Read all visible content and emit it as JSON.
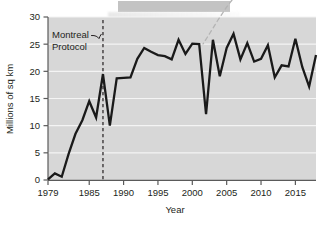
{
  "figure": {
    "redacted_caption_present": true,
    "background_color": "#ffffff"
  },
  "chart_data": {
    "type": "line",
    "title": "",
    "xlabel": "Year",
    "ylabel": "Millions of sq km",
    "xlim": [
      1979,
      2018
    ],
    "ylim": [
      0,
      30
    ],
    "grid": true,
    "grid_orientation": "horizontal",
    "legend_position": "none",
    "plot_background_color": "#d7d7d7",
    "gridline_color": "#f4f4f4",
    "series_color": "#1a1a1a",
    "xticks": [
      1979,
      1985,
      1990,
      1995,
      2000,
      2005,
      2010,
      2015
    ],
    "xtick_labels": [
      "1979",
      "1985",
      "1990",
      "1995",
      "2000",
      "2005",
      "2010",
      "2015"
    ],
    "yticks": [
      0,
      5,
      10,
      15,
      20,
      25,
      30
    ],
    "ytick_labels": [
      "0",
      "5",
      "10",
      "15",
      "20",
      "25",
      "30"
    ],
    "x": [
      1979,
      1980,
      1981,
      1982,
      1983,
      1984,
      1985,
      1986,
      1987,
      1988,
      1989,
      1990,
      1991,
      1992,
      1993,
      1994,
      1995,
      1996,
      1997,
      1998,
      1999,
      2000,
      2001,
      2002,
      2003,
      2004,
      2005,
      2006,
      2007,
      2008,
      2009,
      2010,
      2011,
      2012,
      2013,
      2014,
      2015,
      2016,
      2017,
      2018
    ],
    "values": [
      0.1,
      1.2,
      0.6,
      4.8,
      8.5,
      11.0,
      14.5,
      11.5,
      19.5,
      10.0,
      18.7,
      18.8,
      18.9,
      22.3,
      24.3,
      23.6,
      23.0,
      22.8,
      22.2,
      25.8,
      23.2,
      25.1,
      25.0,
      12.1,
      25.8,
      19.1,
      24.3,
      26.9,
      22.2,
      25.2,
      21.8,
      22.3,
      24.8,
      18.9,
      21.1,
      20.9,
      26.0,
      20.8,
      17.2,
      23.0
    ],
    "annotations": [
      {
        "name": "montreal-protocol",
        "text_line1": "Montreal",
        "text_line2": "Protocol",
        "marker_type": "vertical-dashed-line",
        "marker_x": 1987,
        "leader": true
      },
      {
        "name": "caption-leader",
        "text": "",
        "marker_type": "dashed-leader-line",
        "points_to_x": 1998,
        "points_to_y": 25.8
      }
    ]
  }
}
